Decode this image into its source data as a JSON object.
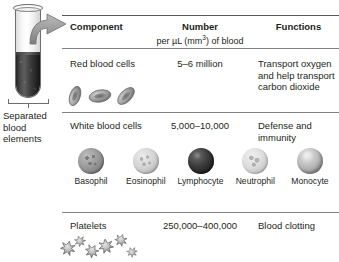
{
  "tube": {
    "caption": "Separated blood elements",
    "plasma_layer_name": "plasma",
    "packed_layer_name": "packed blood cells",
    "arrow_name": "flow-arrow"
  },
  "table": {
    "headers": {
      "component": "Component",
      "number": "Number",
      "number_sub": "per µL (mm",
      "number_sub_sup": "3",
      "number_sub_tail": ") of blood",
      "functions": "Functions"
    },
    "rows": [
      {
        "component": "Red blood cells",
        "number": "5–6 million",
        "functions": "Transport oxygen and help transport carbon dioxide"
      },
      {
        "component": "White blood cells",
        "number": "5,000–10,000",
        "functions": "Defense and immunity"
      },
      {
        "component": "Platelets",
        "number": "250,000–400,000",
        "functions": "Blood clotting"
      }
    ]
  },
  "white_blood_cells": [
    {
      "label": "Basophil",
      "icon": "basophil-cell-icon",
      "shade": "#8d8d8d"
    },
    {
      "label": "Eosinophil",
      "icon": "eosinophil-cell-icon",
      "shade": "#cfcfcf"
    },
    {
      "label": "Lymphocyte",
      "icon": "lymphocyte-cell-icon",
      "shade": "#2b2b2b"
    },
    {
      "label": "Neutrophil",
      "icon": "neutrophil-cell-icon",
      "shade": "#dadada"
    },
    {
      "label": "Monocyte",
      "icon": "monocyte-cell-icon",
      "shade": "#b5b5b5"
    }
  ],
  "icons": {
    "red_blood_cell": "red-blood-cell-icon",
    "platelet": "platelet-icon",
    "test_tube": "test-tube-icon",
    "bracket": "measurement-bracket-icon"
  },
  "colors": {
    "rule": "#58595b",
    "text": "#231f20",
    "background": "#ffffff",
    "packed_cells": "#2a2a2a",
    "plasma": "#f2f2f2",
    "arrow": "#9a9a9a"
  }
}
